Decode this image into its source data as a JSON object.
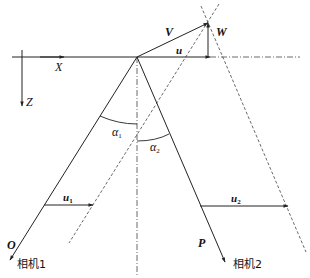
{
  "diagram": {
    "axes": {
      "x_label": "X",
      "z_label": "Z"
    },
    "vectors": {
      "V": "V",
      "W": "W",
      "u": "u",
      "u1_base": "u",
      "u1_sub": "1",
      "u2_base": "u",
      "u2_sub": "2"
    },
    "angles": {
      "a1_base": "α",
      "a1_sub": "1",
      "a2_base": "α",
      "a2_sub": "2"
    },
    "points": {
      "O": "O",
      "P": "P"
    },
    "cameras": {
      "camera1": "相机1",
      "camera2": "相机2"
    },
    "colors": {
      "line": "#222222",
      "background": "#ffffff"
    }
  }
}
